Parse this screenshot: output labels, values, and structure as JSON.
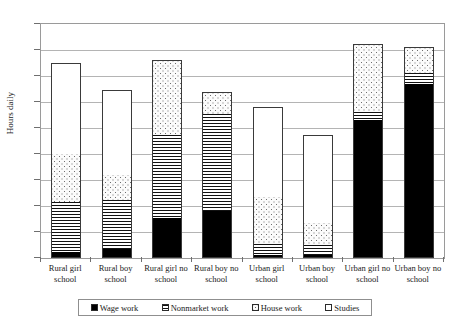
{
  "chart_data": {
    "type": "bar",
    "title": "",
    "subtitle": "",
    "xlabel": "",
    "ylabel": "Hours daily",
    "ylim": [
      0,
      9
    ],
    "ytick_labels": [
      "0",
      "1",
      "2",
      "3",
      "4",
      "5",
      "6",
      "7",
      "8",
      "9"
    ],
    "ytick_values": [
      0,
      1,
      2,
      3,
      4,
      5,
      6,
      7,
      8,
      9
    ],
    "grid": true,
    "stacked": true,
    "legend_position": "bottom",
    "categories": [
      "Rural girl school",
      "Rural boy school",
      "Rural girl no school",
      "Rural boy no school",
      "Urban girl school",
      "Urban boy school",
      "Urban girl no school",
      "Urban boy no school"
    ],
    "category_lines": [
      [
        "Rural girl",
        "school"
      ],
      [
        "Rural boy",
        "school"
      ],
      [
        "Rural girl no",
        "school"
      ],
      [
        "Rural boy no",
        "school"
      ],
      [
        "Urban girl",
        "school"
      ],
      [
        "Urban boy",
        "school"
      ],
      [
        "Urban girl no",
        "school"
      ],
      [
        "Urban boy no",
        "school"
      ]
    ],
    "series": [
      {
        "name": "Wage work",
        "pattern": "solid-black",
        "color": "#000000",
        "values": [
          0.25,
          0.35,
          1.55,
          1.8,
          0.1,
          0.1,
          5.3,
          6.7
        ]
      },
      {
        "name": "Nonmarket work",
        "pattern": "horizontal-lines",
        "color": "#ffffff",
        "values": [
          1.9,
          1.9,
          3.2,
          3.75,
          0.45,
          0.4,
          0.3,
          0.4
        ]
      },
      {
        "name": "House work",
        "pattern": "dotted",
        "color": "#f7f7f7",
        "values": [
          1.85,
          0.95,
          2.85,
          0.85,
          1.8,
          0.85,
          2.65,
          1.0
        ]
      },
      {
        "name": "Studies",
        "pattern": "white",
        "color": "#ffffff",
        "values": [
          3.5,
          3.25,
          0,
          0,
          3.45,
          3.4,
          0,
          0
        ]
      }
    ],
    "totals": [
      7.5,
      6.45,
      7.6,
      6.4,
      5.8,
      4.75,
      8.25,
      8.1
    ]
  },
  "legend": {
    "items": [
      {
        "label": "Wage work",
        "pattern": "solid-black"
      },
      {
        "label": "Nonmarket work",
        "pattern": "horizontal-lines"
      },
      {
        "label": "House work",
        "pattern": "dotted"
      },
      {
        "label": "Studies",
        "pattern": "white"
      }
    ]
  }
}
